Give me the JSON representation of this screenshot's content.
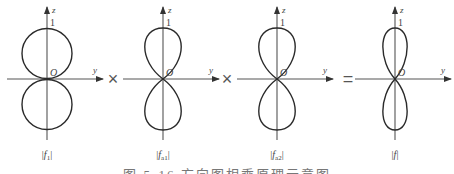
{
  "figure": {
    "panels": [
      {
        "id": "f1",
        "label": "|f1|",
        "sub_base": "f",
        "sub": "1",
        "axis_x": 47,
        "lobe_rx": 25,
        "lobe_ry": 25.5,
        "z_label": "z",
        "y_label": "y",
        "origin_label": "O",
        "tick_label": "1"
      },
      {
        "id": "fa1",
        "label": "|fa1|",
        "sub_base": "f",
        "sub": "a1",
        "axis_x": 163,
        "lobe_rx": 18,
        "lobe_ry": 25.5,
        "z_label": "z",
        "y_label": "y",
        "origin_label": "O",
        "tick_label": "1"
      },
      {
        "id": "fa2",
        "label": "|fa2|",
        "sub_base": "f",
        "sub": "a2",
        "axis_x": 277,
        "lobe_rx": 18,
        "lobe_ry": 25.5,
        "z_label": "z",
        "y_label": "y",
        "origin_label": "O",
        "tick_label": "1"
      },
      {
        "id": "f",
        "label": "|f|",
        "sub_base": "f",
        "sub": "",
        "axis_x": 395,
        "lobe_rx": 12,
        "lobe_ry": 25.5,
        "z_label": "z",
        "y_label": "y",
        "origin_label": "O",
        "tick_label": "1"
      }
    ],
    "operators": [
      {
        "symbol": "×",
        "x": 113
      },
      {
        "symbol": "×",
        "x": 227
      },
      {
        "symbol": "=",
        "x": 348
      }
    ],
    "caption": "图 5-16  方向图相乘原理示意图"
  },
  "colors": {
    "line": "#2a2a2a",
    "axis": "#555555",
    "text": "#444444"
  }
}
